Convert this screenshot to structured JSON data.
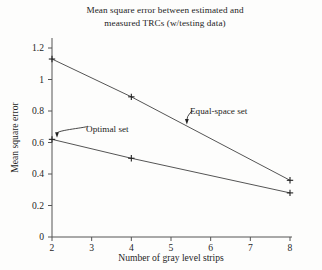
{
  "chart_data": {
    "type": "line",
    "title": "Mean square error between estimated and measured TRCs (w/testing data)",
    "title_lines": [
      "Mean square error between estimated and",
      "measured TRCs (w/testing data)"
    ],
    "xlabel": "Number of gray level strips",
    "ylabel": "Mean square error",
    "xlim": [
      2,
      8
    ],
    "ylim": [
      0,
      1.2
    ],
    "grid": false,
    "legend_position": "inline-annotations",
    "marker": "plus",
    "line_color": "#555555",
    "xticks": [
      "2",
      "3",
      "4",
      "5",
      "6",
      "7",
      "8"
    ],
    "xtick_values": [
      2,
      3,
      4,
      5,
      6,
      7,
      8
    ],
    "yticks": [
      "0",
      "0.2",
      "0.4",
      "0.6",
      "0.8",
      "1",
      "1.2"
    ],
    "ytick_values": [
      0,
      0.2,
      0.4,
      0.6,
      0.8,
      1,
      1.2
    ],
    "x": [
      2,
      4,
      8
    ],
    "series": [
      {
        "name": "Equal-space set",
        "values": [
          1.13,
          0.89,
          0.36
        ]
      },
      {
        "name": "Optimal set",
        "values": [
          0.62,
          0.5,
          0.28
        ]
      }
    ],
    "annotations": [
      {
        "text": "Optimal set",
        "series": "Optimal set",
        "points_to_x": 2
      },
      {
        "text": "Equal-space set",
        "series": "Equal-space set",
        "points_to_x": 5.4
      }
    ]
  }
}
